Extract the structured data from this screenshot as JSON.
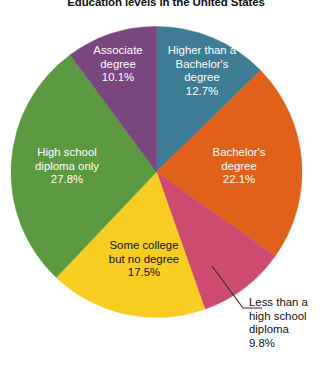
{
  "title": "Education levels in the United States",
  "chart_data": {
    "type": "pie",
    "title": "Education levels in the United States",
    "xlabel": "",
    "ylabel": "",
    "units": "percent",
    "start_angle_deg": 0,
    "direction": "clockwise",
    "legend": "none (labels drawn on slices)",
    "grid": false,
    "total": 100.0,
    "categories": [
      "Higher than a Bachelor's degree",
      "Bachelor's degree",
      "Less than a high school diploma",
      "Some college but no degree",
      "High school diploma only",
      "Associate degree"
    ],
    "values": [
      12.7,
      22.1,
      9.8,
      17.5,
      27.8,
      10.1
    ],
    "colors": [
      "#3E7C95",
      "#E2611A",
      "#CE4A6E",
      "#F9CE23",
      "#5C9A42",
      "#7B4580"
    ],
    "slices": [
      {
        "name": "higher-than-bachelors",
        "label_line1": "Higher than a",
        "label_line2": "Bachelor's",
        "label_line3": "degree",
        "percent": "12.7%",
        "value": 12.7,
        "color": "#3E7C95",
        "label_placement": "inside",
        "label_color": "#ffffff"
      },
      {
        "name": "bachelors-degree",
        "label_line1": "Bachelor's",
        "label_line2": "degree",
        "label_line3": "",
        "percent": "22.1%",
        "value": 22.1,
        "color": "#E2611A",
        "label_placement": "inside",
        "label_color": "#ffffff"
      },
      {
        "name": "less-than-high-school",
        "label_line1": "Less than a",
        "label_line2": "high school",
        "label_line3": "diploma",
        "percent": "9.8%",
        "value": 9.8,
        "color": "#CE4A6E",
        "label_placement": "outside-callout",
        "label_color": "#111111"
      },
      {
        "name": "some-college",
        "label_line1": "Some college",
        "label_line2": "but no degree",
        "label_line3": "",
        "percent": "17.5%",
        "value": 17.5,
        "color": "#F9CE23",
        "label_placement": "inside",
        "label_color": "#111111"
      },
      {
        "name": "high-school-only",
        "label_line1": "High school",
        "label_line2": "diploma only",
        "label_line3": "",
        "percent": "27.8%",
        "value": 27.8,
        "color": "#5C9A42",
        "label_placement": "inside",
        "label_color": "#ffffff"
      },
      {
        "name": "associate-degree",
        "label_line1": "Associate",
        "label_line2": "degree",
        "label_line3": "",
        "percent": "10.1%",
        "value": 10.1,
        "color": "#7B4580",
        "label_placement": "inside",
        "label_color": "#ffffff"
      }
    ]
  }
}
